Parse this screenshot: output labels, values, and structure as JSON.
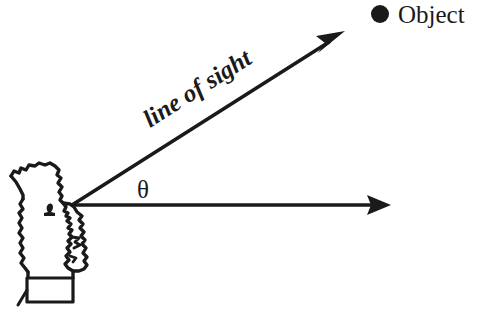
{
  "diagram": {
    "background_color": "#ffffff",
    "ink_color": "#1a1a1a",
    "labels": {
      "object": "Object",
      "line_of_sight": "line of sight",
      "angle": "θ"
    },
    "elements": {
      "observer": "observer-head-profile",
      "object_marker": "filled-dot",
      "sight_arrow": "diagonal-arrow-up-right",
      "horizontal_arrow": "horizontal-reference-arrow"
    },
    "geometry": {
      "vertex_x": 72,
      "vertex_y": 205,
      "horizontal_tip_x": 390,
      "horizontal_tip_y": 205,
      "sight_tip_x": 343,
      "sight_tip_y": 33,
      "angle_degrees": 33,
      "object_dot_x": 380,
      "object_dot_y": 14,
      "object_dot_radius": 9
    }
  }
}
